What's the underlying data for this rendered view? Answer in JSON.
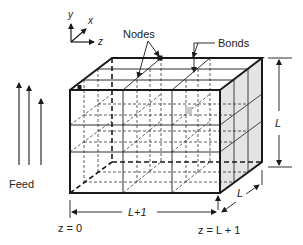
{
  "diagram": {
    "type": "3D lattice cube schematic",
    "axes": {
      "y": "y",
      "x": "x",
      "z": "z"
    },
    "labels": {
      "nodes": "Nodes",
      "bonds": "Bonds",
      "feed": "Feed",
      "height": "L",
      "depth": "L",
      "length": "L+1",
      "z_start": "z = 0",
      "z_end": "z = L + 1"
    },
    "colors": {
      "line": "#1a1a1a",
      "shaded_face": "#e4e4e4",
      "background": "#ffffff"
    }
  }
}
